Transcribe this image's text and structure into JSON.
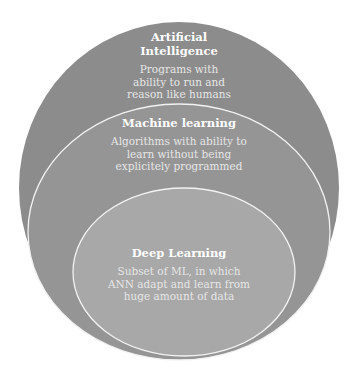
{
  "diagram": {
    "type": "nested-circles",
    "layers": [
      {
        "title": "Artificial Intelligence",
        "title_lines": [
          "Artificial",
          "Intelligence"
        ],
        "description_lines": [
          "Programs with",
          "ability to run and",
          "reason like humans"
        ],
        "fill": "#8c8c8c"
      },
      {
        "title": "Machine learning",
        "title_lines": [
          "Machine learning"
        ],
        "description_lines": [
          "Algorithms with ability to",
          "learn without being",
          "explicitely programmed"
        ],
        "fill": "#999999"
      },
      {
        "title": "Deep Learning",
        "title_lines": [
          "Deep Learning"
        ],
        "description_lines": [
          "Subset of ML, in which",
          "ANN adapt and learn from",
          "huge amount of data"
        ],
        "fill": "#ababab"
      }
    ],
    "outline_color": "#f2f2f2"
  }
}
